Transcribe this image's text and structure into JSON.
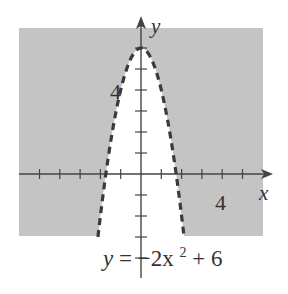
{
  "chart_data": {
    "type": "area",
    "title": "",
    "equation_label": {
      "lhs": "y",
      "eq": "=",
      "rhs_coef": "−2x",
      "rhs_exp": "2",
      "rhs_tail": " + 6"
    },
    "boundary": {
      "function": "y = -2x^2 + 6",
      "style": "dashed",
      "vertex": [
        0,
        6
      ],
      "x_intercepts": [
        -1.732,
        1.732
      ]
    },
    "shaded_region": "y > -2x^2 + 6",
    "xlabel": "x",
    "ylabel": "y",
    "xlim": [
      -6,
      6
    ],
    "ylim": [
      -3,
      7
    ],
    "x_ticks": [
      -5,
      -4,
      -3,
      -2,
      -1,
      1,
      2,
      3,
      4,
      5
    ],
    "y_ticks": [
      -4,
      -3,
      -2,
      -1,
      1,
      2,
      3,
      4,
      5,
      6
    ],
    "x_tick_labels": {
      "4": "4"
    },
    "y_tick_labels": {
      "4": "4"
    },
    "grid": false,
    "colors": {
      "shade": "#c4c4c4",
      "curve": "#3a3a3a",
      "axis": "#444444"
    }
  },
  "labels": {
    "x_axis": "x",
    "y_axis": "y",
    "x_tick_4": "4",
    "y_tick_4": "4"
  }
}
